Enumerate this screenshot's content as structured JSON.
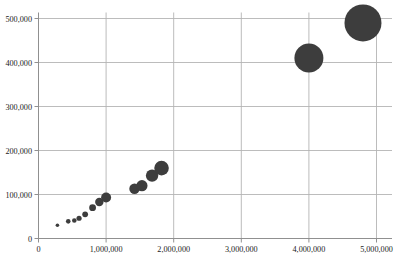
{
  "chart_data": {
    "type": "scatter",
    "title": "",
    "subtitle": "",
    "xlabel": "",
    "ylabel": "",
    "xlim": [
      0,
      5000000
    ],
    "ylim": [
      0,
      500000
    ],
    "grid": true,
    "legend": null,
    "marker_color": "#3d3d3d",
    "axis_color": "#909090",
    "grid_color": "#b4b4b4",
    "xticks": [
      0,
      1000000,
      2000000,
      3000000,
      4000000,
      5000000
    ],
    "xticklabels": [
      "0",
      "1,000,000",
      "2,000,000",
      "3,000,000",
      "4,000,000",
      "5,000,000"
    ],
    "yticks": [
      0,
      100000,
      200000,
      300000,
      400000,
      500000
    ],
    "yticklabels": [
      "0",
      "100,000",
      "200,000",
      "300,000",
      "400,000",
      "500,000"
    ],
    "note": "bubble sizes vary with marker size; size values given as marker radius in px",
    "points": [
      {
        "x": 280000,
        "y": 30000,
        "r": 1.8
      },
      {
        "x": 440000,
        "y": 39000,
        "r": 2.3
      },
      {
        "x": 530000,
        "y": 41000,
        "r": 2.3
      },
      {
        "x": 600000,
        "y": 46000,
        "r": 2.6
      },
      {
        "x": 690000,
        "y": 55000,
        "r": 2.9
      },
      {
        "x": 800000,
        "y": 70000,
        "r": 3.4
      },
      {
        "x": 900000,
        "y": 83000,
        "r": 4.2
      },
      {
        "x": 1000000,
        "y": 93000,
        "r": 5.0
      },
      {
        "x": 1420000,
        "y": 113000,
        "r": 5.2
      },
      {
        "x": 1530000,
        "y": 120000,
        "r": 5.6
      },
      {
        "x": 1680000,
        "y": 143000,
        "r": 6.2
      },
      {
        "x": 1820000,
        "y": 160000,
        "r": 7.3
      },
      {
        "x": 4000000,
        "y": 410000,
        "r": 14.5
      },
      {
        "x": 4800000,
        "y": 490000,
        "r": 18.5
      }
    ]
  }
}
